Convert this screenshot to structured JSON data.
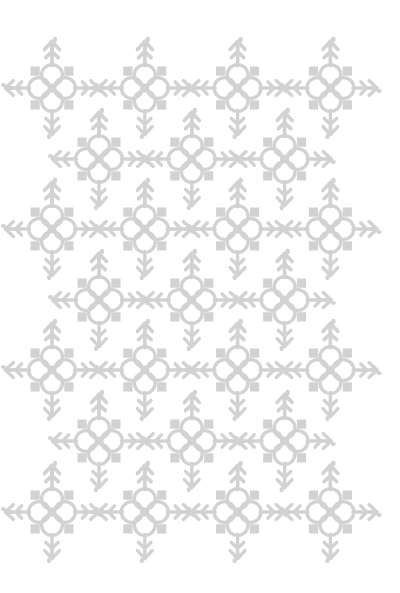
{
  "document": {
    "kind": "decorative-pattern-image",
    "title": "Snowflake Seamless Pattern",
    "width": 400,
    "height": 593
  },
  "canvas": {
    "background_color": "#ffffff",
    "width": 400,
    "height": 593
  },
  "motif": {
    "name": "snowflake",
    "color": "#d2d2d2",
    "stroke_color": "#d2d2d2",
    "stroke_width": 3.4,
    "base_size": 96,
    "parts": [
      "center-square",
      "petal-circle-top",
      "petal-circle-right",
      "petal-circle-bottom",
      "petal-circle-left",
      "corner-square-top-left",
      "corner-square-top-right",
      "corner-square-bottom-right",
      "corner-square-bottom-left",
      "arm-up",
      "arm-right",
      "arm-down",
      "arm-left"
    ]
  },
  "layout": {
    "type": "staggered-brick-grid",
    "column_pitch": 92.8,
    "row_pitch": 70.8,
    "rows": [
      {
        "row_index": 0,
        "cy": 88,
        "offset": false,
        "count": 4,
        "cx": [
          52,
          144.8,
          237.6,
          330.4
        ]
      },
      {
        "row_index": 1,
        "cy": 159,
        "offset": true,
        "count": 3,
        "cx": [
          99,
          191.8,
          284.6
        ]
      },
      {
        "row_index": 2,
        "cy": 229,
        "offset": false,
        "count": 4,
        "cx": [
          52,
          144.8,
          237.6,
          330.4
        ]
      },
      {
        "row_index": 3,
        "cy": 300,
        "offset": true,
        "count": 3,
        "cx": [
          99,
          191.8,
          284.6
        ]
      },
      {
        "row_index": 4,
        "cy": 370,
        "offset": false,
        "count": 4,
        "cx": [
          52,
          144.8,
          237.6,
          330.4
        ]
      },
      {
        "row_index": 5,
        "cy": 441,
        "offset": true,
        "count": 3,
        "cx": [
          99,
          191.8,
          284.6
        ]
      },
      {
        "row_index": 6,
        "cy": 512,
        "offset": false,
        "count": 4,
        "cx": [
          52,
          144.8,
          237.6,
          330.4
        ]
      }
    ]
  },
  "margins": {
    "top_whitespace": 28,
    "bottom_whitespace": 36
  }
}
